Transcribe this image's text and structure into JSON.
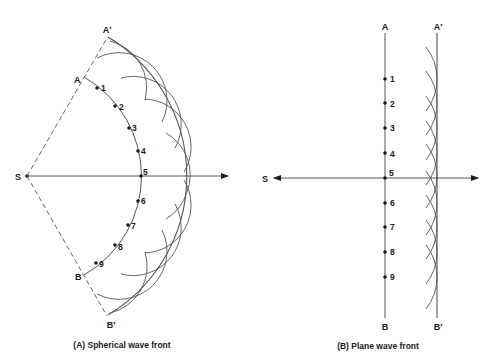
{
  "colors": {
    "ink": "#1a1a1a",
    "line": "#555555",
    "background": "#ffffff"
  },
  "panel_a": {
    "caption": "(A) Spherical wave front",
    "source_label": "S",
    "inner_front_labels": {
      "top": "A",
      "bottom": "B"
    },
    "outer_front_labels": {
      "top": "A′",
      "bottom": "B′"
    },
    "point_labels": [
      "1",
      "2",
      "3",
      "4",
      "5",
      "6",
      "7",
      "8",
      "9"
    ]
  },
  "panel_b": {
    "caption": "(B) Plane wave front",
    "source_label": "S",
    "inner_front_labels": {
      "top": "A",
      "bottom": "B"
    },
    "outer_front_labels": {
      "top": "A′",
      "bottom": "B′"
    },
    "point_labels": [
      "1",
      "2",
      "3",
      "4",
      "5",
      "6",
      "7",
      "8",
      "9"
    ]
  }
}
